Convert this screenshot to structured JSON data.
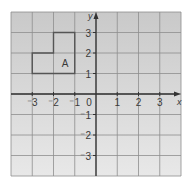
{
  "figure": {
    "type": "coordinate-grid",
    "x_axis": {
      "label": "x",
      "min": -4,
      "max": 4,
      "tick_labels": [
        {
          "value": -3,
          "text": "⁻3"
        },
        {
          "value": -2,
          "text": "⁻2"
        },
        {
          "value": -1,
          "text": "⁻1"
        },
        {
          "value": 0,
          "text": "0"
        },
        {
          "value": 1,
          "text": "1"
        },
        {
          "value": 2,
          "text": "2"
        },
        {
          "value": 3,
          "text": "3"
        }
      ]
    },
    "y_axis": {
      "label": "y",
      "min": -4,
      "max": 4,
      "tick_labels": [
        {
          "value": 3,
          "text": "3"
        },
        {
          "value": 2,
          "text": "2"
        },
        {
          "value": 1,
          "text": "1"
        },
        {
          "value": -1,
          "text": "⁻1"
        },
        {
          "value": -2,
          "text": "⁻2"
        },
        {
          "value": -3,
          "text": "⁻3"
        }
      ]
    },
    "shapes": [
      {
        "label": "A",
        "vertices": [
          [
            -3,
            1
          ],
          [
            -1,
            1
          ],
          [
            -1,
            3
          ],
          [
            -2,
            3
          ],
          [
            -2,
            2
          ],
          [
            -3,
            2
          ]
        ],
        "label_position": [
          -1.5,
          1.5
        ]
      }
    ],
    "colors": {
      "background_top": "#c9c9c9",
      "background_bottom": "#e8e8e8",
      "grid_line": "#8e8e8e",
      "axis": "#333333",
      "shape_outline": "#555555",
      "text": "#3a3a3a"
    }
  }
}
